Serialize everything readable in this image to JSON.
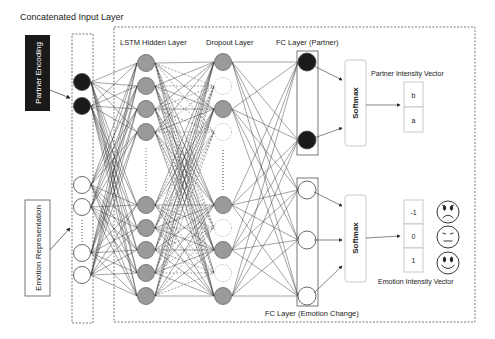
{
  "title": "Concatenated Input Layer",
  "layers": {
    "lstm": "LSTM Hidden Layer",
    "dropout": "Dropout Layer",
    "fc_partner": "FC Layer (Partner)",
    "fc_emotion": "FC Layer (Emotion Change)"
  },
  "inputs": {
    "partner": "Partner Encoding",
    "emotion": "Emotion Representation"
  },
  "softmax": {
    "top": "Softmax",
    "bottom": "Softmax"
  },
  "partner_vector": {
    "label": "Partner Intensity Vector",
    "cells": [
      "b",
      "a"
    ]
  },
  "emotion_vector": {
    "label": "Emotion Intensity Vector",
    "cells": [
      "-1",
      "0",
      "1"
    ]
  },
  "faces": [
    "sad-face",
    "neutral-face",
    "happy-face"
  ],
  "colors": {
    "input_filled": "#1a1a1a",
    "hidden_node": "#9a9a9a",
    "dropout_dashed": "#aaaaaa",
    "line": "#333333",
    "box_border": "#555555"
  }
}
